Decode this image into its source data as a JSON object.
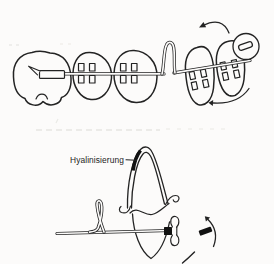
{
  "figure": {
    "background_color": "#fcfbfa",
    "ink_color": "#232323",
    "hyalinization_fill_color": "#111111",
    "scan_artifact_color": "#dcdbd5",
    "lower_diagram": {
      "label": "Hyalinisierung"
    }
  }
}
